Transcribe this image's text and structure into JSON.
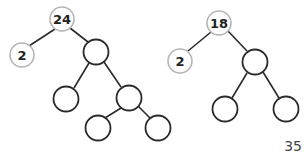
{
  "trees": [
    {
      "name": "factor-tree-24",
      "root": {
        "label": "24",
        "x": 62,
        "y": 19
      },
      "nodes": [
        {
          "id": "n1",
          "label": "2",
          "x": 22,
          "y": 55,
          "labeled": true
        },
        {
          "id": "n2",
          "label": "",
          "x": 96,
          "y": 52,
          "labeled": false
        },
        {
          "id": "n3",
          "label": "",
          "x": 66,
          "y": 99,
          "labeled": false
        },
        {
          "id": "n4",
          "label": "",
          "x": 129,
          "y": 98,
          "labeled": false
        },
        {
          "id": "n5",
          "label": "",
          "x": 98,
          "y": 128,
          "labeled": false
        },
        {
          "id": "n6",
          "label": "",
          "x": 158,
          "y": 128,
          "labeled": false
        }
      ]
    },
    {
      "name": "factor-tree-18",
      "root": {
        "label": "18",
        "x": 219,
        "y": 23
      },
      "nodes": [
        {
          "id": "m1",
          "label": "2",
          "x": 180,
          "y": 61,
          "labeled": true
        },
        {
          "id": "m2",
          "label": "",
          "x": 255,
          "y": 62,
          "labeled": false
        },
        {
          "id": "m3",
          "label": "",
          "x": 225,
          "y": 109,
          "labeled": false
        },
        {
          "id": "m4",
          "label": "",
          "x": 286,
          "y": 109,
          "labeled": false
        }
      ]
    }
  ],
  "tree1": {
    "root_label": "24",
    "left_label": "2"
  },
  "tree2": {
    "root_label": "18",
    "left_label": "2"
  },
  "page": {
    "number": "35"
  },
  "colors": {
    "edge": "#2a2a2a",
    "labeled_ring": "#b5b5b5",
    "empty_ring": "#2a2a2a"
  }
}
